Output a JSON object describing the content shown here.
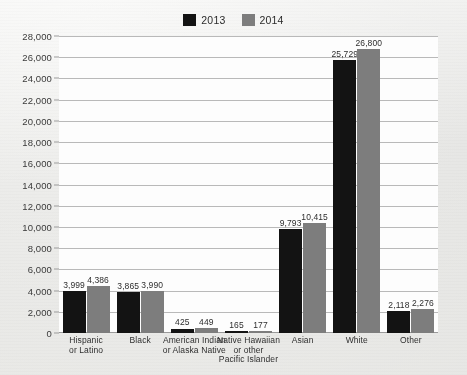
{
  "chart_data": {
    "type": "bar",
    "title": "",
    "subtitle": "",
    "xlabel": "",
    "ylabel": "",
    "grid": true,
    "legend_position": "top-center",
    "ylim": [
      0,
      28000
    ],
    "ytick_step": 2000,
    "ytick_labels": [
      "0",
      "2,000",
      "4,000",
      "6,000",
      "8,000",
      "10,000",
      "12,000",
      "14,000",
      "16,000",
      "18,000",
      "20,000",
      "22,000",
      "24,000",
      "26,000",
      "28,000"
    ],
    "ytick_values": [
      0,
      2000,
      4000,
      6000,
      8000,
      10000,
      12000,
      14000,
      16000,
      18000,
      20000,
      22000,
      24000,
      26000,
      28000
    ],
    "categories": [
      "Hispanic\nor Latino",
      "Black",
      "American Indian\nor Alaska Native",
      "Native Hawaiian\nor other\nPacific Islander",
      "Asian",
      "White",
      "Other"
    ],
    "category_lines": [
      [
        "Hispanic",
        "or Latino"
      ],
      [
        "Black"
      ],
      [
        "American Indian",
        "or Alaska Native"
      ],
      [
        "Native Hawaiian",
        "or other",
        "Pacific Islander"
      ],
      [
        "Asian"
      ],
      [
        "White"
      ],
      [
        "Other"
      ]
    ],
    "series": [
      {
        "name": "2013",
        "color": "#131313",
        "values": [
          3999,
          3865,
          425,
          165,
          9793,
          25729,
          2118
        ],
        "value_labels": [
          "3,999",
          "3,865",
          "425",
          "165",
          "9,793",
          "25,729",
          "2,118"
        ]
      },
      {
        "name": "2014",
        "color": "#7d7d7d",
        "values": [
          4386,
          3990,
          449,
          177,
          10415,
          26800,
          2276
        ],
        "value_labels": [
          "4,386",
          "3,990",
          "449",
          "177",
          "10,415",
          "26,800",
          "2,276"
        ]
      }
    ]
  },
  "legend": {
    "entries": [
      {
        "label": "2013",
        "color": "#131313"
      },
      {
        "label": "2014",
        "color": "#7d7d7d"
      }
    ]
  }
}
